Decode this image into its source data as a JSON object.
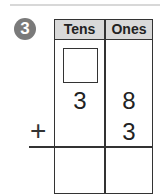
{
  "problem": {
    "number": "3",
    "columns": [
      "Tens",
      "Ones"
    ],
    "carry_box": "",
    "addend1": {
      "tens": "3",
      "ones": "8"
    },
    "addend2": {
      "tens": "",
      "ones": "3"
    },
    "operator": "+",
    "answer": {
      "tens": "",
      "ones": ""
    }
  },
  "colors": {
    "badge": "#7a7a7a",
    "header_bg": "#d9d9d9",
    "lines": "#333333"
  }
}
